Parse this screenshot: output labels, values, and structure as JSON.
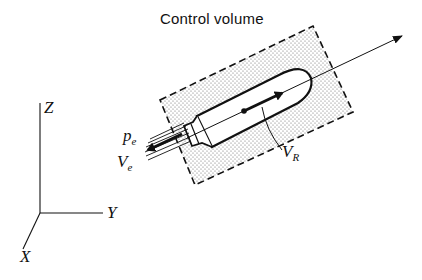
{
  "title": "Control volume",
  "labels": {
    "pe": {
      "main": "p",
      "sub": "e"
    },
    "ve": {
      "main": "V",
      "sub": "e"
    },
    "vr": {
      "main": "V",
      "sub": "R"
    },
    "axis_z": "Z",
    "axis_y": "Y",
    "axis_x": "X"
  },
  "colors": {
    "ink": "#111111",
    "stipple": "#8a8a8a",
    "background": "#ffffff"
  }
}
